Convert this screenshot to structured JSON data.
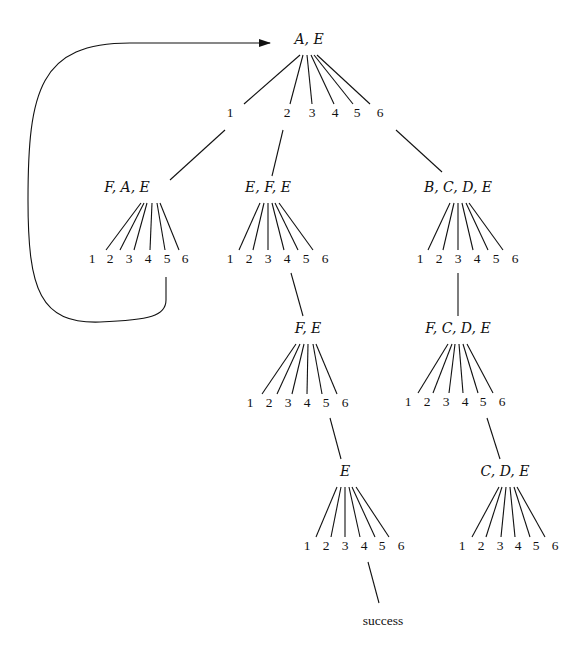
{
  "diagram": {
    "type": "search-tree",
    "loop_arrow": {
      "from_node": "fae",
      "from_choice": "5",
      "to_node": "root"
    },
    "nodes": [
      {
        "id": "root",
        "label": "A, E",
        "x": 309,
        "y": 44,
        "children_y": 117,
        "choices": [
          {
            "label": "1",
            "x": 230
          },
          {
            "label": "2",
            "x": 287
          },
          {
            "label": "3",
            "x": 312
          },
          {
            "label": "4",
            "x": 335
          },
          {
            "label": "5",
            "x": 357
          },
          {
            "label": "6",
            "x": 380
          }
        ],
        "fan_top": [
          300,
          303,
          307,
          311,
          314,
          317
        ],
        "fan_bottom": [
          244,
          290,
          312,
          334,
          353,
          370
        ]
      },
      {
        "id": "fae",
        "label": "F, A, E",
        "x": 127,
        "y": 192,
        "children_y": 263,
        "choices": [
          {
            "label": "1",
            "x": 92
          },
          {
            "label": "2",
            "x": 110
          },
          {
            "label": "3",
            "x": 129
          },
          {
            "label": "4",
            "x": 148
          },
          {
            "label": "5",
            "x": 167
          },
          {
            "label": "6",
            "x": 185
          }
        ],
        "fan_top": [
          141,
          144,
          147,
          152,
          157,
          160
        ],
        "fan_bottom": [
          106,
          120,
          134,
          150,
          165,
          179
        ]
      },
      {
        "id": "efe",
        "label": "E, F, E",
        "x": 268,
        "y": 192,
        "children_y": 263,
        "choices": [
          {
            "label": "1",
            "x": 230
          },
          {
            "label": "2",
            "x": 249
          },
          {
            "label": "3",
            "x": 268
          },
          {
            "label": "4",
            "x": 287
          },
          {
            "label": "5",
            "x": 306
          },
          {
            "label": "6",
            "x": 325
          }
        ],
        "fan_top": [
          260,
          264,
          268,
          272,
          275,
          279
        ],
        "fan_bottom": [
          239,
          253,
          268,
          284,
          298,
          313
        ]
      },
      {
        "id": "bcde",
        "label": "B, C, D, E",
        "x": 458,
        "y": 192,
        "children_y": 263,
        "choices": [
          {
            "label": "1",
            "x": 420
          },
          {
            "label": "2",
            "x": 439
          },
          {
            "label": "3",
            "x": 458
          },
          {
            "label": "4",
            "x": 477
          },
          {
            "label": "5",
            "x": 496
          },
          {
            "label": "6",
            "x": 515
          }
        ],
        "fan_top": [
          450,
          454,
          458,
          462,
          466,
          469
        ],
        "fan_bottom": [
          428,
          443,
          458,
          473,
          488,
          503
        ]
      },
      {
        "id": "fe",
        "label": "F, E",
        "x": 308,
        "y": 333,
        "children_y": 407,
        "choices": [
          {
            "label": "1",
            "x": 250
          },
          {
            "label": "2",
            "x": 269
          },
          {
            "label": "3",
            "x": 288
          },
          {
            "label": "4",
            "x": 307
          },
          {
            "label": "5",
            "x": 326
          },
          {
            "label": "6",
            "x": 345
          }
        ],
        "fan_top": [
          296,
          300,
          304,
          308,
          313,
          316
        ],
        "fan_bottom": [
          262,
          277,
          292,
          307,
          322,
          337
        ]
      },
      {
        "id": "fcde",
        "label": "F, C, D, E",
        "x": 458,
        "y": 333,
        "children_y": 406,
        "choices": [
          {
            "label": "1",
            "x": 408
          },
          {
            "label": "2",
            "x": 427
          },
          {
            "label": "3",
            "x": 446
          },
          {
            "label": "4",
            "x": 465
          },
          {
            "label": "5",
            "x": 483
          },
          {
            "label": "6",
            "x": 502
          }
        ],
        "fan_top": [
          448,
          452,
          455,
          459,
          463,
          467
        ],
        "fan_bottom": [
          418,
          433,
          449,
          463,
          478,
          493
        ]
      },
      {
        "id": "e",
        "label": "E",
        "x": 345,
        "y": 476,
        "children_y": 550,
        "choices": [
          {
            "label": "1",
            "x": 307
          },
          {
            "label": "2",
            "x": 326
          },
          {
            "label": "3",
            "x": 345
          },
          {
            "label": "4",
            "x": 364
          },
          {
            "label": "5",
            "x": 382
          },
          {
            "label": "6",
            "x": 401
          }
        ],
        "fan_top": [
          337,
          341,
          345,
          349,
          352,
          356
        ],
        "fan_bottom": [
          316,
          331,
          345,
          360,
          375,
          389
        ]
      },
      {
        "id": "cde",
        "label": "C, D, E",
        "x": 505,
        "y": 476,
        "children_y": 550,
        "choices": [
          {
            "label": "1",
            "x": 462
          },
          {
            "label": "2",
            "x": 481
          },
          {
            "label": "3",
            "x": 500
          },
          {
            "label": "4",
            "x": 518
          },
          {
            "label": "5",
            "x": 536
          },
          {
            "label": "6",
            "x": 555
          }
        ],
        "fan_top": [
          499,
          502,
          506,
          510,
          514,
          517
        ],
        "fan_bottom": [
          472,
          486,
          501,
          515,
          530,
          545
        ]
      }
    ],
    "branch_links": [
      {
        "from": "root",
        "choice": "1",
        "x1": 225,
        "y1": 130,
        "x2": 170,
        "y2": 180,
        "to": "fae"
      },
      {
        "from": "root",
        "choice": "2",
        "x1": 283,
        "y1": 130,
        "x2": 272,
        "y2": 176,
        "to": "efe"
      },
      {
        "from": "root",
        "choice": "6",
        "x1": 396,
        "y1": 130,
        "x2": 442,
        "y2": 172,
        "to": "bcde"
      },
      {
        "from": "efe",
        "choice": "4",
        "x1": 291,
        "y1": 273,
        "x2": 303,
        "y2": 316,
        "to": "fe"
      },
      {
        "from": "bcde",
        "choice": "3",
        "x1": 458,
        "y1": 273,
        "x2": 458,
        "y2": 316,
        "to": "fcde"
      },
      {
        "from": "fe",
        "choice": "5",
        "x1": 330,
        "y1": 418,
        "x2": 341,
        "y2": 459,
        "to": "e"
      },
      {
        "from": "fcde",
        "choice": "5",
        "x1": 487,
        "y1": 418,
        "x2": 500,
        "y2": 459,
        "to": "cde"
      },
      {
        "from": "e",
        "choice": "4",
        "x1": 368,
        "y1": 562,
        "x2": 379,
        "y2": 603,
        "to": "success"
      }
    ],
    "terminal": {
      "id": "success",
      "label": "success",
      "x": 383,
      "y": 625
    }
  }
}
